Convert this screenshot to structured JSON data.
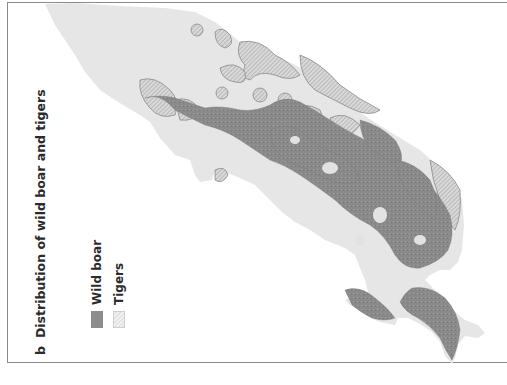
{
  "figure": {
    "panel_letter": "b",
    "title": "Distribution of wild boar and tigers"
  },
  "legend": {
    "items": [
      {
        "label": "Wild boar",
        "swatch": "solid-dark-gray",
        "color": "#8c8c8c"
      },
      {
        "label": "Tigers",
        "swatch": "hatched-light-gray",
        "color": "#e2e2e2"
      }
    ]
  },
  "map": {
    "land_color": "#e6e6e6",
    "boar_color": "#8c8c8c",
    "tiger_hatch_color": "#9a9a9a",
    "frame_color": "#8a8a8a"
  }
}
